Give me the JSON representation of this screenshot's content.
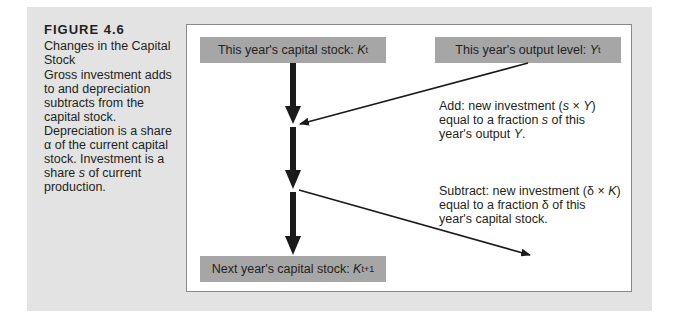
{
  "figure": {
    "number": "FIGURE 4.6",
    "title": "Changes in the Capital Stock",
    "description_parts": {
      "p1": "Gross investment adds to and depreciation subtracts from the capital stock. Depreciation is a share ",
      "alpha": "α",
      "p2": " of the current capital stock. Investment is a share ",
      "s": "s",
      "p3": " of current production."
    }
  },
  "diagram": {
    "box_current_capital": {
      "label": "This year's capital stock: ",
      "var": "K",
      "sub": "t"
    },
    "box_output": {
      "label": "This year's output level: ",
      "var": "Y",
      "sub": "t"
    },
    "box_next_capital": {
      "label": "Next year's capital stock: ",
      "var": "K",
      "sub": "t+1"
    },
    "note_add": {
      "l1a": "Add: new investment (",
      "l1s": "s",
      "l1b": " × ",
      "l1y": "Y",
      "l1c": ")",
      "l2a": "equal to a fraction ",
      "l2s": "s",
      "l2b": " of this",
      "l3a": "year's output ",
      "l3y": "Y",
      "l3b": "."
    },
    "note_subtract": {
      "l1a": "Subtract: new investment (δ × ",
      "l1k": "K",
      "l1b": ")",
      "l2": "equal to a fraction δ of this",
      "l3": "year's capital stock."
    },
    "colors": {
      "panel": "#e3e3e3",
      "box": "#a6a6a6",
      "arrow": "#1a1a1a"
    }
  }
}
